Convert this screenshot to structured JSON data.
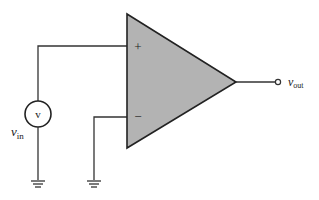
{
  "diagram": {
    "type": "op-amp circuit",
    "components": {
      "opamp": {
        "plus_label": "+",
        "minus_label": "−",
        "fill": "#b3b3b3",
        "stroke": "#222222"
      },
      "source": {
        "symbol": "v",
        "label_main": "v",
        "label_sub": "in"
      },
      "output": {
        "label_main": "v",
        "label_sub": "out"
      }
    },
    "grounds": [
      "source-ground",
      "inverting-input-ground"
    ]
  }
}
